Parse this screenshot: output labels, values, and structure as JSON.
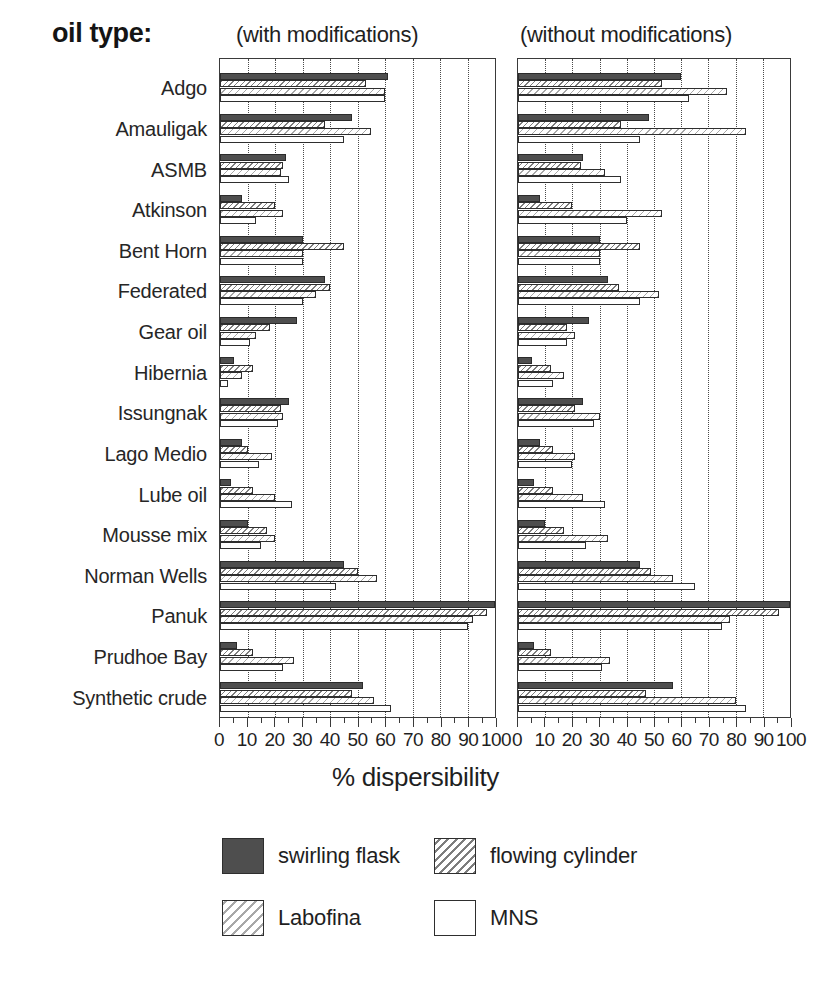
{
  "header": {
    "oil_type_label": "oil type:",
    "panel_left_caption": "(with modifications)",
    "panel_right_caption": "(without modifications)"
  },
  "axis": {
    "x_title": "% dispersibility",
    "tick_labels": [
      "0",
      "10",
      "20",
      "30",
      "40",
      "50",
      "60",
      "70",
      "80",
      "90",
      "100"
    ]
  },
  "legend": {
    "items": [
      {
        "label": "swirling flask",
        "pattern": "solid-dark"
      },
      {
        "label": "flowing cylinder",
        "pattern": "diagonal-hatch-dark"
      },
      {
        "label": "Labofina",
        "pattern": "diagonal-hatch-light"
      },
      {
        "label": "MNS",
        "pattern": "empty-white"
      }
    ]
  },
  "chart_data": {
    "type": "bar",
    "orientation": "horizontal",
    "title": "oil type:",
    "xlabel": "% dispersibility",
    "ylabel": "oil type",
    "xlim": [
      0,
      100
    ],
    "grid": "vertical-dotted-every-10",
    "legend_position": "bottom",
    "panels": [
      {
        "name": "with modifications",
        "caption": "(with modifications)",
        "categories": [
          "Adgo",
          "Amauligak",
          "ASMB",
          "Atkinson",
          "Bent Horn",
          "Federated",
          "Gear oil",
          "Hibernia",
          "Issungnak",
          "Lago Medio",
          "Lube oil",
          "Mousse mix",
          "Norman Wells",
          "Panuk",
          "Prudhoe Bay",
          "Synthetic crude"
        ],
        "series": [
          {
            "name": "swirling flask",
            "values": [
              61,
              48,
              24,
              8,
              30,
              38,
              28,
              5,
              25,
              8,
              4,
              10,
              45,
              100,
              6,
              52
            ]
          },
          {
            "name": "flowing cylinder",
            "values": [
              53,
              38,
              23,
              20,
              45,
              40,
              18,
              12,
              22,
              10,
              12,
              17,
              50,
              97,
              12,
              48
            ]
          },
          {
            "name": "Labofina",
            "values": [
              60,
              55,
              22,
              23,
              30,
              35,
              13,
              8,
              23,
              19,
              20,
              20,
              57,
              92,
              27,
              56
            ]
          },
          {
            "name": "MNS",
            "values": [
              60,
              45,
              25,
              13,
              30,
              30,
              11,
              3,
              21,
              14,
              26,
              15,
              42,
              90,
              23,
              62
            ]
          }
        ]
      },
      {
        "name": "without modifications",
        "caption": "(without modifications)",
        "categories": [
          "Adgo",
          "Amauligak",
          "ASMB",
          "Atkinson",
          "Bent Horn",
          "Federated",
          "Gear oil",
          "Hibernia",
          "Issungnak",
          "Lago Medio",
          "Lube oil",
          "Mousse mix",
          "Norman Wells",
          "Panuk",
          "Prudhoe Bay",
          "Synthetic crude"
        ],
        "series": [
          {
            "name": "swirling flask",
            "values": [
              60,
              48,
              24,
              8,
              30,
              33,
              26,
              5,
              24,
              8,
              6,
              10,
              45,
              100,
              6,
              57
            ]
          },
          {
            "name": "flowing cylinder",
            "values": [
              53,
              38,
              23,
              20,
              45,
              37,
              18,
              12,
              21,
              13,
              13,
              17,
              49,
              96,
              12,
              47
            ]
          },
          {
            "name": "Labofina",
            "values": [
              77,
              84,
              32,
              53,
              30,
              52,
              21,
              17,
              30,
              21,
              24,
              33,
              57,
              78,
              34,
              80
            ]
          },
          {
            "name": "MNS",
            "values": [
              63,
              45,
              38,
              40,
              30,
              45,
              18,
              13,
              28,
              20,
              32,
              25,
              65,
              75,
              31,
              84
            ]
          }
        ]
      }
    ]
  }
}
